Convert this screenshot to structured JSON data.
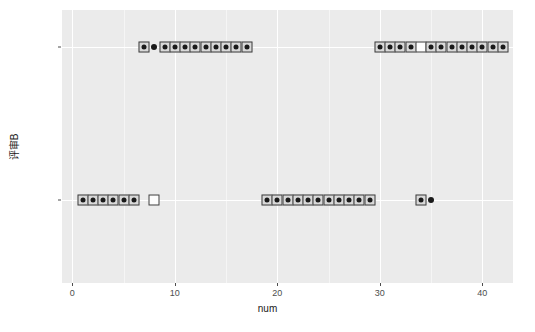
{
  "chart_data": {
    "type": "scatter",
    "title": "",
    "xlabel": "num",
    "ylabel": "评审B",
    "xlim": [
      -1,
      43
    ],
    "ylim_categories": [
      "未通过",
      "通过"
    ],
    "xticks": [
      0,
      10,
      20,
      30,
      40
    ],
    "xtick_labels": [
      "0",
      "10",
      "20",
      "30",
      "40"
    ],
    "ytick_labels": [
      "通过",
      "未通过"
    ],
    "grid": true,
    "legend": "none",
    "panel_background": "#ebebeb",
    "gridline_color": "#ffffff",
    "marker_fill": "#d9d9d9",
    "marker_edge": "#3b3b3b",
    "dot_color": "#1a1a1a",
    "series": [
      {
        "name": "通过",
        "y": "通过",
        "points": [
          {
            "x": 7,
            "marker": "square-dot"
          },
          {
            "x": 8,
            "marker": "dot"
          },
          {
            "x": 9,
            "marker": "square-dot"
          },
          {
            "x": 10,
            "marker": "square-dot"
          },
          {
            "x": 11,
            "marker": "square-dot"
          },
          {
            "x": 12,
            "marker": "square-dot"
          },
          {
            "x": 13,
            "marker": "square-dot"
          },
          {
            "x": 14,
            "marker": "square-dot"
          },
          {
            "x": 15,
            "marker": "square-dot"
          },
          {
            "x": 16,
            "marker": "square-dot"
          },
          {
            "x": 17,
            "marker": "square-dot"
          },
          {
            "x": 30,
            "marker": "square-dot"
          },
          {
            "x": 31,
            "marker": "square-dot"
          },
          {
            "x": 32,
            "marker": "square-dot"
          },
          {
            "x": 33,
            "marker": "square-dot"
          },
          {
            "x": 34,
            "marker": "square-empty"
          },
          {
            "x": 35,
            "marker": "square-dot"
          },
          {
            "x": 36,
            "marker": "square-dot"
          },
          {
            "x": 37,
            "marker": "square-dot"
          },
          {
            "x": 38,
            "marker": "square-dot"
          },
          {
            "x": 39,
            "marker": "square-dot"
          },
          {
            "x": 40,
            "marker": "square-dot"
          },
          {
            "x": 41,
            "marker": "square-dot"
          },
          {
            "x": 42,
            "marker": "square-dot"
          }
        ]
      },
      {
        "name": "未通过",
        "y": "未通过",
        "points": [
          {
            "x": 1,
            "marker": "square-dot"
          },
          {
            "x": 2,
            "marker": "square-dot"
          },
          {
            "x": 3,
            "marker": "square-dot"
          },
          {
            "x": 4,
            "marker": "square-dot"
          },
          {
            "x": 5,
            "marker": "square-dot"
          },
          {
            "x": 6,
            "marker": "square-dot"
          },
          {
            "x": 8,
            "marker": "square-empty"
          },
          {
            "x": 19,
            "marker": "square-dot"
          },
          {
            "x": 20,
            "marker": "square-dot"
          },
          {
            "x": 21,
            "marker": "square-dot"
          },
          {
            "x": 22,
            "marker": "square-dot"
          },
          {
            "x": 23,
            "marker": "square-dot"
          },
          {
            "x": 24,
            "marker": "square-dot"
          },
          {
            "x": 25,
            "marker": "square-dot"
          },
          {
            "x": 26,
            "marker": "square-dot"
          },
          {
            "x": 27,
            "marker": "square-dot"
          },
          {
            "x": 28,
            "marker": "square-dot"
          },
          {
            "x": 29,
            "marker": "square-dot"
          },
          {
            "x": 34,
            "marker": "square-dot"
          },
          {
            "x": 35,
            "marker": "dot"
          }
        ]
      }
    ]
  }
}
